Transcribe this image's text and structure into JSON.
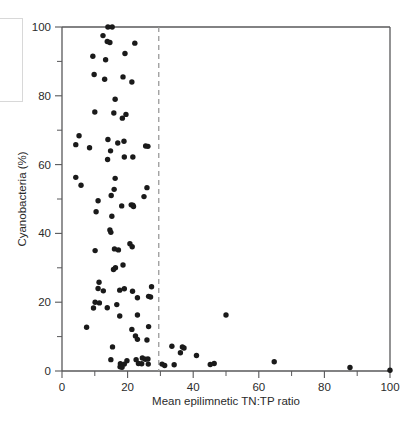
{
  "chart_data": {
    "type": "scatter",
    "title": "",
    "xlabel": "Mean epilimnetic TN:TP ratio",
    "ylabel": "Cyanobacteria (%)",
    "xlim": [
      0,
      100
    ],
    "ylim": [
      0,
      100
    ],
    "xticks": [
      0,
      20,
      40,
      60,
      80,
      100
    ],
    "xticklabels": [
      "0",
      "20",
      "40",
      "60",
      "80",
      "100"
    ],
    "xminorticks": [
      10,
      30,
      50,
      70,
      90
    ],
    "yticks": [
      0,
      20,
      40,
      60,
      80,
      100
    ],
    "yticklabels": [
      "0",
      "20",
      "40",
      "60",
      "80",
      "100"
    ],
    "yminorticks": [
      10,
      30,
      50,
      70,
      90
    ],
    "grid": false,
    "legend": null,
    "marker": "filled-circle",
    "marker_color": "#1a1a1a",
    "annotations": [
      {
        "name": "tn-tp-threshold-line",
        "type": "vertical-dashed-line",
        "x": 29.5,
        "color": "#9a9a9a",
        "style": "dashed"
      }
    ],
    "series": [
      {
        "name": "lakes",
        "points": [
          [
            14.0,
            100.0
          ],
          [
            15.3,
            100.0
          ],
          [
            12.5,
            97.5
          ],
          [
            13.8,
            95.8
          ],
          [
            14.6,
            95.5
          ],
          [
            22.2,
            95.3
          ],
          [
            19.2,
            92.3
          ],
          [
            9.4,
            91.5
          ],
          [
            13.3,
            90.5
          ],
          [
            9.8,
            86.2
          ],
          [
            18.6,
            85.5
          ],
          [
            13.0,
            84.8
          ],
          [
            21.3,
            84.0
          ],
          [
            16.2,
            79.0
          ],
          [
            10.0,
            75.3
          ],
          [
            15.8,
            75.0
          ],
          [
            19.5,
            74.6
          ],
          [
            18.4,
            73.5
          ],
          [
            5.2,
            68.4
          ],
          [
            14.0,
            67.3
          ],
          [
            18.9,
            66.8
          ],
          [
            17.0,
            66.3
          ],
          [
            4.2,
            65.8
          ],
          [
            8.4,
            64.9
          ],
          [
            14.8,
            64.0
          ],
          [
            25.5,
            65.4
          ],
          [
            26.2,
            65.3
          ],
          [
            13.9,
            61.5
          ],
          [
            19.0,
            62.2
          ],
          [
            21.6,
            62.2
          ],
          [
            4.2,
            56.3
          ],
          [
            16.2,
            56.0
          ],
          [
            5.8,
            54.0
          ],
          [
            15.9,
            52.8
          ],
          [
            25.9,
            53.3
          ],
          [
            15.0,
            51.0
          ],
          [
            25.0,
            50.7
          ],
          [
            11.0,
            49.5
          ],
          [
            18.2,
            48.0
          ],
          [
            21.1,
            48.3
          ],
          [
            21.6,
            48.2
          ],
          [
            21.8,
            47.8
          ],
          [
            10.4,
            46.3
          ],
          [
            15.2,
            45.0
          ],
          [
            14.6,
            41.0
          ],
          [
            14.9,
            40.3
          ],
          [
            20.7,
            37.0
          ],
          [
            21.4,
            36.1
          ],
          [
            10.1,
            35.0
          ],
          [
            16.0,
            35.5
          ],
          [
            17.2,
            35.2
          ],
          [
            18.6,
            30.8
          ],
          [
            16.3,
            30.0
          ],
          [
            15.7,
            29.5
          ],
          [
            11.3,
            25.8
          ],
          [
            11.0,
            24.0
          ],
          [
            19.0,
            23.9
          ],
          [
            27.3,
            24.5
          ],
          [
            12.6,
            23.3
          ],
          [
            17.6,
            23.5
          ],
          [
            21.5,
            23.2
          ],
          [
            23.0,
            21.3
          ],
          [
            26.4,
            21.7
          ],
          [
            27.0,
            21.5
          ],
          [
            10.1,
            20.0
          ],
          [
            11.4,
            19.8
          ],
          [
            16.7,
            19.3
          ],
          [
            9.6,
            18.3
          ],
          [
            13.8,
            18.4
          ],
          [
            17.6,
            16.0
          ],
          [
            23.0,
            16.3
          ],
          [
            50.0,
            16.3
          ],
          [
            7.5,
            12.7
          ],
          [
            21.3,
            12.1
          ],
          [
            26.4,
            12.9
          ],
          [
            22.4,
            10.2
          ],
          [
            23.0,
            9.2
          ],
          [
            25.9,
            9.0
          ],
          [
            15.4,
            7.0
          ],
          [
            33.5,
            7.2
          ],
          [
            36.7,
            7.0
          ],
          [
            37.2,
            6.7
          ],
          [
            36.1,
            5.3
          ],
          [
            41.0,
            4.5
          ],
          [
            14.9,
            3.3
          ],
          [
            19.8,
            3.0
          ],
          [
            22.6,
            3.3
          ],
          [
            24.5,
            3.8
          ],
          [
            25.4,
            3.4
          ],
          [
            26.2,
            3.5
          ],
          [
            64.7,
            2.7
          ],
          [
            17.8,
            2.1
          ],
          [
            19.0,
            2.0
          ],
          [
            23.3,
            2.2
          ],
          [
            24.3,
            2.1
          ],
          [
            26.3,
            2.0
          ],
          [
            30.5,
            2.0
          ],
          [
            31.3,
            1.6
          ],
          [
            34.2,
            1.8
          ],
          [
            45.2,
            1.9
          ],
          [
            46.4,
            2.2
          ],
          [
            17.7,
            1.2
          ],
          [
            18.3,
            1.1
          ],
          [
            87.8,
            1.0
          ],
          [
            100.0,
            0.2
          ]
        ]
      }
    ]
  },
  "axes": {
    "x_title": "Mean epilimnetic TN:TP ratio",
    "y_title": "Cyanobacteria (%)"
  }
}
